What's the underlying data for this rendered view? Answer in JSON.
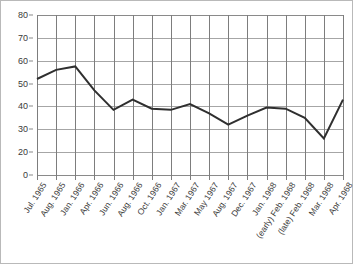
{
  "chart_data": {
    "type": "line",
    "title": "",
    "subtitle": "",
    "xlabel": "",
    "ylabel": "",
    "ylim": [
      0,
      80
    ],
    "ytick_labels": [
      "0",
      "20",
      "30",
      "40",
      "50",
      "60",
      "70",
      "80"
    ],
    "ytick_values": [
      0,
      20,
      30,
      40,
      50,
      60,
      70,
      80
    ],
    "grid": true,
    "legend": null,
    "legend_position": "none",
    "categories": [
      "Jul. 1965",
      "Aug. 1965",
      "Jan. 1966",
      "Apr. 1966",
      "Jun. 1966",
      "Aug. 1966",
      "Oct. 1966",
      "Jan. 1967",
      "Mar. 1967",
      "May 1967",
      "Aug. 1967",
      "Dec. 1967",
      "Jan. 1968",
      "(early) Feb. 1968",
      "(late) Feb. 1968",
      "Mar. 1968",
      "Apr. 1968"
    ],
    "values": [
      52,
      56,
      57.5,
      47,
      38.5,
      43,
      39,
      38.5,
      41,
      37,
      32,
      36,
      39.5,
      39,
      35,
      26,
      43
    ],
    "series": [
      {
        "name": "series-1",
        "color": "#2f2f2f",
        "values": [
          52,
          56,
          57.5,
          47,
          38.5,
          43,
          39,
          38.5,
          41,
          37,
          32,
          36,
          39.5,
          39,
          35,
          26,
          43
        ]
      }
    ],
    "colors": {
      "line": "#2f2f2f",
      "grid_horizontal": "#a6a6a6",
      "grid_vertical": "#7d7d7d",
      "axis": "#8a8a8a",
      "text": "#3a3a3a",
      "background": "#ffffff",
      "border": "#b9b9b9"
    }
  }
}
